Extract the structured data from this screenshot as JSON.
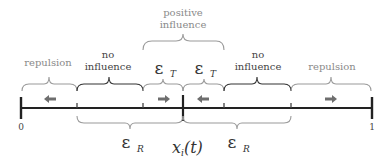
{
  "diagram": {
    "axis": {
      "start_label": "0",
      "end_label": "1",
      "center_label": "x",
      "center_sub": "i",
      "center_suffix": "(t)"
    },
    "top_regions": [
      {
        "id": "repulsion-left",
        "label": "repulsion",
        "style": "gray",
        "arrow": "left"
      },
      {
        "id": "no-influence-left",
        "label_line1": "no",
        "label_line2": "influence",
        "style": "dark"
      },
      {
        "id": "epsilon-t-left",
        "symbol": "ε",
        "sub": "T",
        "arrow": "right"
      },
      {
        "id": "epsilon-t-right",
        "symbol": "ε",
        "sub": "T",
        "arrow": "left"
      },
      {
        "id": "no-influence-right",
        "label_line1": "no",
        "label_line2": "influence",
        "style": "dark"
      },
      {
        "id": "repulsion-right",
        "label": "repulsion",
        "style": "gray",
        "arrow": "right"
      }
    ],
    "positive_influence": {
      "line1": "positive",
      "line2": "influence"
    },
    "bottom_regions": [
      {
        "id": "epsilon-r-left",
        "symbol": "ε",
        "sub": "R"
      },
      {
        "id": "epsilon-r-right",
        "symbol": "ε",
        "sub": "R"
      }
    ],
    "colors": {
      "axis": "#222222",
      "arrow": "#6e6e6e",
      "gray_text": "#8a8a8a",
      "dark_text": "#444444"
    }
  }
}
